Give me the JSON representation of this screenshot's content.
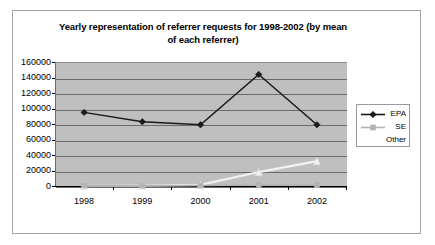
{
  "chart_data": {
    "type": "line",
    "title": "Yearly representation of referrer requests for 1998-2002 (by mean of each referrer)",
    "title_line1": "Yearly representation of referrer requests for 1998-2002 (by mean",
    "title_line2": "of each referrer)",
    "xlabel": "",
    "ylabel": "",
    "categories": [
      "1998",
      "1999",
      "2000",
      "2001",
      "2002"
    ],
    "ylim": [
      0,
      160000
    ],
    "ytick_labels": [
      "160000",
      "140000",
      "120000",
      "100000",
      "80000",
      "60000",
      "40000",
      "20000",
      "0"
    ],
    "ytick_values": [
      160000,
      140000,
      120000,
      100000,
      80000,
      60000,
      40000,
      20000,
      0
    ],
    "grid": true,
    "legend_position": "right",
    "series": [
      {
        "name": "EPA",
        "values": [
          95000,
          83000,
          79000,
          144000,
          79000
        ],
        "color": "#1a1a1a",
        "marker": "diamond"
      },
      {
        "name": "SE",
        "values": [
          600,
          500,
          700,
          1200,
          1100
        ],
        "color": "#b3b3b3",
        "marker": "square"
      },
      {
        "name": "Other",
        "values": [
          300,
          400,
          1500,
          18000,
          32000
        ],
        "color": "#f2f2f2",
        "marker": "triangle"
      }
    ]
  },
  "legend": {
    "items": [
      {
        "label": "EPA"
      },
      {
        "label": "SE"
      },
      {
        "label": "Other"
      }
    ]
  },
  "colors": {
    "plot_background": "#bfbfbf",
    "gridline": "#6b6b6b",
    "frame_border": "#a6a6a6",
    "page_background": "#ffffff",
    "epa": "#1a1a1a",
    "se": "#b3b3b3",
    "other": "#f2f2f2"
  }
}
